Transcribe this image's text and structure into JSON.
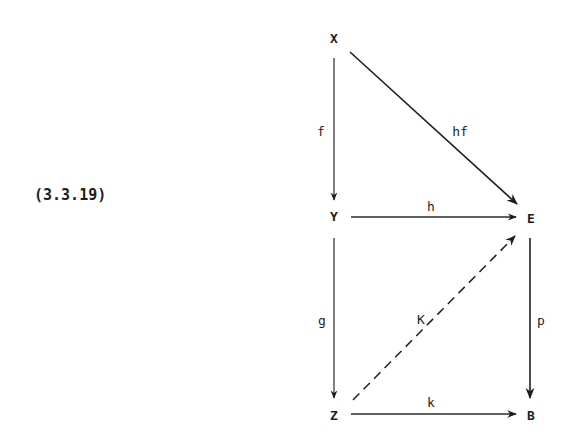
{
  "equation_number": "(3.3.19)",
  "diagram": {
    "type": "commutative-diagram",
    "nodes": {
      "X": {
        "label": "X",
        "x": 334,
        "y": 39
      },
      "Y": {
        "label": "Y",
        "x": 334,
        "y": 217
      },
      "E": {
        "label": "E",
        "x": 531,
        "y": 219
      },
      "Z": {
        "label": "Z",
        "x": 334,
        "y": 416
      },
      "B": {
        "label": "B",
        "x": 531,
        "y": 416
      }
    },
    "arrows": [
      {
        "from": "X",
        "to": "Y",
        "label": "f",
        "style": "solid"
      },
      {
        "from": "X",
        "to": "E",
        "label": "hf",
        "style": "solid"
      },
      {
        "from": "Y",
        "to": "E",
        "label": "h",
        "style": "solid"
      },
      {
        "from": "Y",
        "to": "Z",
        "label": "g",
        "style": "solid"
      },
      {
        "from": "Z",
        "to": "E",
        "label": "K",
        "style": "dashed"
      },
      {
        "from": "E",
        "to": "B",
        "label": "p",
        "style": "solid"
      },
      {
        "from": "Z",
        "to": "B",
        "label": "k",
        "style": "solid"
      }
    ],
    "labels": {
      "f": "f",
      "hf": "hf",
      "h": "h",
      "g": "g",
      "K": "K",
      "p": "p",
      "k": "k"
    }
  }
}
